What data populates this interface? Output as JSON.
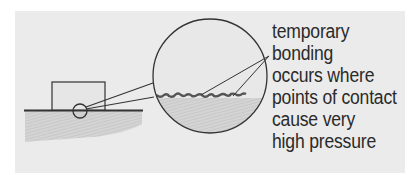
{
  "figure": {
    "caption_lines": [
      "temporary",
      "bonding",
      "occurs where",
      "points of contact",
      "cause very",
      "high pressure"
    ],
    "elements": {
      "block": "block resting on surface",
      "surface": "hatched ground surface",
      "contact_circle": "small circle marking contact region",
      "magnified_view": "magnified circle showing rough contact points"
    },
    "colors": {
      "panel_bg": "#ebebeb",
      "line": "#333333",
      "ground": "#d0d0d0",
      "text": "#2a2a2a"
    }
  }
}
